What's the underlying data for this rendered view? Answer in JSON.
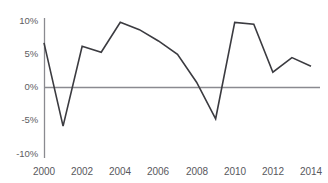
{
  "chart_data": {
    "type": "line",
    "title": "",
    "xlabel": "",
    "ylabel": "",
    "x": [
      2000,
      2001,
      2002,
      2003,
      2004,
      2005,
      2006,
      2007,
      2008,
      2009,
      2010,
      2011,
      2012,
      2013,
      2014
    ],
    "values": [
      6.7,
      -5.8,
      6.2,
      5.3,
      9.8,
      8.7,
      7.0,
      5.0,
      0.8,
      -4.7,
      9.8,
      9.5,
      2.3,
      4.5,
      3.2
    ],
    "series": [
      {
        "name": "series-1",
        "values": [
          6.7,
          -5.8,
          6.2,
          5.3,
          9.8,
          8.7,
          7.0,
          5.0,
          0.8,
          -4.7,
          9.8,
          9.5,
          2.3,
          4.5,
          3.2
        ]
      }
    ],
    "xlim": [
      2000,
      2014
    ],
    "ylim": [
      -10,
      10
    ],
    "grid": false,
    "legend": null,
    "y_ticks": [
      10,
      5,
      0,
      -5,
      -10
    ],
    "y_tick_labels": [
      "10%",
      "5%",
      "0%",
      "-5%",
      "-10%"
    ],
    "x_ticks": [
      2000,
      2002,
      2004,
      2006,
      2008,
      2010,
      2012,
      2014
    ],
    "x_tick_labels": [
      "2000",
      "2002",
      "2004",
      "2006",
      "2008",
      "2010",
      "2012",
      "2014"
    ],
    "zero_line": 0,
    "line_color": "#3b3b40",
    "axis_color": "#8a8a90",
    "zero_line_color": "#8a8a90",
    "tick_label_color": "#58585d",
    "background_color": "#ffffff"
  },
  "clipped_header": {
    "text": "—  ——  ——  —  ——"
  },
  "y_axis": {
    "labels": [
      "10%",
      "5%",
      "0%",
      "-5%",
      "-10%"
    ]
  },
  "x_axis": {
    "labels": [
      "2000",
      "2002",
      "2004",
      "2006",
      "2008",
      "2010",
      "2012",
      "2014"
    ]
  }
}
